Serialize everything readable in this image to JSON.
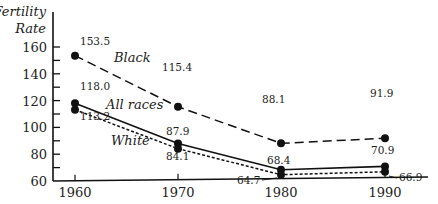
{
  "chart_data": {
    "type": "line",
    "title": "",
    "xlabel": "",
    "ylabel": "Fertility Rate",
    "ylabel_lines": [
      "Fertility",
      "Rate"
    ],
    "x": [
      1960,
      1970,
      1980,
      1990
    ],
    "x_tick_labels": [
      "1960",
      "1970",
      "1980",
      "1990"
    ],
    "y_ticks": [
      60,
      80,
      100,
      120,
      140,
      160
    ],
    "y_tick_labels": [
      "60",
      "80",
      "100",
      "120",
      "140",
      "160"
    ],
    "ylim": [
      60,
      160
    ],
    "grid": false,
    "legend": "inline labels",
    "series": [
      {
        "name": "Black",
        "style": "dashed",
        "values": [
          153.5,
          115.4,
          88.1,
          91.9
        ],
        "value_labels": [
          "153.5",
          "115.4",
          "88.1",
          "91.9"
        ]
      },
      {
        "name": "All races",
        "style": "solid",
        "values": [
          118.0,
          87.9,
          68.4,
          70.9
        ],
        "value_labels": [
          "118.0",
          "87.9",
          "68.4",
          "70.9"
        ]
      },
      {
        "name": "White",
        "style": "dotted",
        "values": [
          113.2,
          84.1,
          64.7,
          66.9
        ],
        "value_labels": [
          "113.2",
          "84.1",
          "64.7",
          "66.9"
        ]
      }
    ]
  }
}
